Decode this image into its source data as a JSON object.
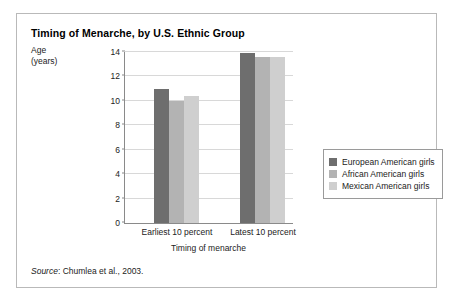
{
  "figure": {
    "title": "Timing of Menarche, by U.S. Ethnic Group",
    "source_word": "Source",
    "source_text": ": Chumlea et al., 2003."
  },
  "axes": {
    "y_title_line1": "Age",
    "y_title_line2": "(years)",
    "x_title": "Timing of menarche"
  },
  "colors": {
    "series_1": "#6e6e6e",
    "series_2": "#b3b3b3",
    "series_3": "#cfcfcf",
    "frame": "#b9b9b9",
    "axis": "#8a8a8a",
    "gridline": "#d8d8d8"
  },
  "chart_data": {
    "type": "bar",
    "title": "Timing of Menarche, by U.S. Ethnic Group",
    "xlabel": "Timing of menarche",
    "ylabel": "Age (years)",
    "categories": [
      "Earliest 10 percent",
      "Latest 10 percent"
    ],
    "series": [
      {
        "name": "European American girls",
        "values": [
          11.0,
          13.9
        ]
      },
      {
        "name": "African American girls",
        "values": [
          10.0,
          13.6
        ]
      },
      {
        "name": "Mexican American girls",
        "values": [
          10.4,
          13.6
        ]
      }
    ],
    "ylim": [
      0,
      14
    ],
    "yticks": [
      0,
      2,
      4,
      6,
      8,
      10,
      12,
      14
    ],
    "ytick_labels": [
      "0",
      "2",
      "4",
      "6",
      "8",
      "10",
      "12",
      "14"
    ],
    "grid": true,
    "legend_position": "right"
  }
}
